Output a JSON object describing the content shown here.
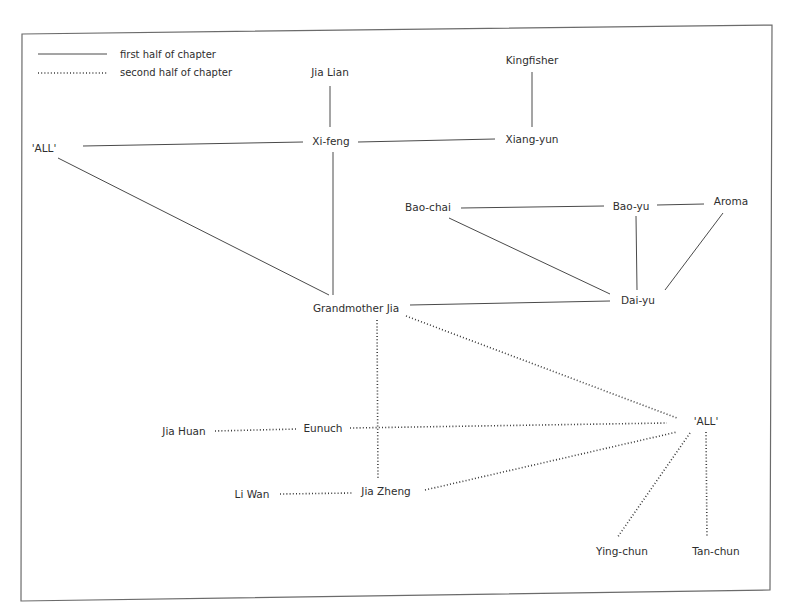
{
  "legend": {
    "solid_label": "first half of chapter",
    "dotted_label": "second half of chapter"
  },
  "colors": {
    "text": "#2e2e2e",
    "line": "#4a4a4a",
    "frame": "#6b6b6b",
    "background": "#ffffff"
  },
  "nodes": {
    "jia_lian": {
      "label": "Jia Lian"
    },
    "kingfisher": {
      "label": "Kingfisher"
    },
    "all_top": {
      "label": "'ALL'"
    },
    "xi_feng": {
      "label": "Xi-feng"
    },
    "xiang_yun": {
      "label": "Xiang-yun"
    },
    "bao_chai": {
      "label": "Bao-chai"
    },
    "bao_yu": {
      "label": "Bao-yu"
    },
    "aroma": {
      "label": "Aroma"
    },
    "grandmother_jia": {
      "label": "Grandmother Jia"
    },
    "dai_yu": {
      "label": "Dai-yu"
    },
    "jia_huan": {
      "label": "Jia Huan"
    },
    "eunuch": {
      "label": "Eunuch"
    },
    "all_bottom": {
      "label": "'ALL'"
    },
    "li_wan": {
      "label": "Li Wan"
    },
    "jia_zheng": {
      "label": "Jia Zheng"
    },
    "ying_chun": {
      "label": "Ying-chun"
    },
    "tan_chun": {
      "label": "Tan-chun"
    }
  },
  "edges": {
    "first_half": [
      [
        "jia_lian",
        "xi_feng"
      ],
      [
        "kingfisher",
        "xiang_yun"
      ],
      [
        "all_top",
        "xi_feng"
      ],
      [
        "xi_feng",
        "xiang_yun"
      ],
      [
        "all_top",
        "grandmother_jia"
      ],
      [
        "xi_feng",
        "grandmother_jia"
      ],
      [
        "bao_chai",
        "bao_yu"
      ],
      [
        "bao_yu",
        "aroma"
      ],
      [
        "bao_chai",
        "dai_yu"
      ],
      [
        "bao_yu",
        "dai_yu"
      ],
      [
        "aroma",
        "dai_yu"
      ],
      [
        "grandmother_jia",
        "dai_yu"
      ]
    ],
    "second_half": [
      [
        "grandmother_jia",
        "all_bottom"
      ],
      [
        "grandmother_jia",
        "jia_zheng"
      ],
      [
        "jia_huan",
        "eunuch"
      ],
      [
        "eunuch",
        "all_bottom"
      ],
      [
        "li_wan",
        "jia_zheng"
      ],
      [
        "jia_zheng",
        "all_bottom"
      ],
      [
        "all_bottom",
        "ying_chun"
      ],
      [
        "all_bottom",
        "tan_chun"
      ]
    ]
  }
}
